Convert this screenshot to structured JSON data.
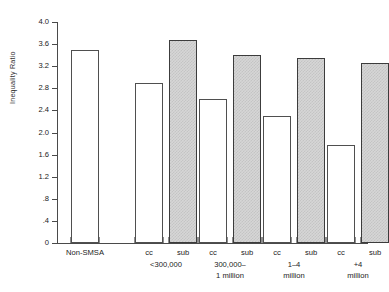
{
  "chart_data": {
    "type": "bar",
    "title": "",
    "subtitle": "",
    "xlabel": "",
    "ylabel": "Inequality Ratio",
    "ylim": [
      0,
      4.0
    ],
    "grid": false,
    "legend_position": "none",
    "y_ticks": [
      "0",
      ".4",
      ".8",
      "1.2",
      "1.6",
      "2.0",
      "2.4",
      "2.8",
      "3.2",
      "3.6",
      "4.0"
    ],
    "y_tick_values": [
      0,
      0.4,
      0.8,
      1.2,
      1.6,
      2.0,
      2.4,
      2.8,
      3.2,
      3.6,
      4.0
    ],
    "categories": [
      "Non-SMSA",
      "cc",
      "sub",
      "cc",
      "sub",
      "cc",
      "sub",
      "cc",
      "sub"
    ],
    "values": [
      3.5,
      2.9,
      3.68,
      2.6,
      3.4,
      2.3,
      3.35,
      1.78,
      3.25
    ],
    "bar_types": [
      "cc",
      "cc",
      "sub",
      "cc",
      "sub",
      "cc",
      "sub",
      "cc",
      "sub"
    ],
    "groups": [
      {
        "label": "",
        "bars": [
          {
            "label": "Non-SMSA",
            "type": "cc",
            "value": 3.5
          }
        ]
      },
      {
        "label": "<300,000",
        "bars": [
          {
            "label": "cc",
            "type": "cc",
            "value": 2.9
          },
          {
            "label": "sub",
            "type": "sub",
            "value": 3.68
          }
        ]
      },
      {
        "label": "300,000–\n1 million",
        "bars": [
          {
            "label": "cc",
            "type": "cc",
            "value": 2.6
          },
          {
            "label": "sub",
            "type": "sub",
            "value": 3.4
          }
        ]
      },
      {
        "label": "1–4\nmillion",
        "bars": [
          {
            "label": "cc",
            "type": "cc",
            "value": 2.3
          },
          {
            "label": "sub",
            "type": "sub",
            "value": 3.35
          }
        ]
      },
      {
        "label": "+4\nmillion",
        "bars": [
          {
            "label": "cc",
            "type": "cc",
            "value": 1.78
          },
          {
            "label": "sub",
            "type": "sub",
            "value": 3.25
          }
        ]
      }
    ],
    "colors": {
      "cc_fill": "#ffffff",
      "sub_fill": "#d6d6d6",
      "bar_outline": "#4f4f4f",
      "axis": "#4a4a4a",
      "background": "#ffffff"
    }
  }
}
